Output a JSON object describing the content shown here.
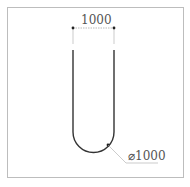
{
  "diagram": {
    "type": "u-shaped rebar / hairpin technical drawing",
    "dimensions": {
      "width_label": "1000",
      "diameter_label": "⌀1000"
    },
    "colors": {
      "shape_stroke": "#333333",
      "dimension_line": "#aaaaaa",
      "frame": "#bdbdbd",
      "text": "#555555"
    }
  }
}
